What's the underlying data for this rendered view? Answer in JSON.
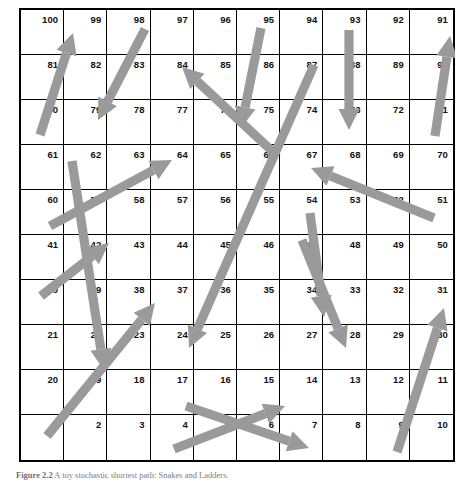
{
  "figure": {
    "caption_label": "Figure 2.2",
    "caption_text": "A toy stochastic shortest path: Snakes and Ladders.",
    "board_title": "Snakes and Ladders board"
  },
  "board": {
    "columns": 10,
    "rows": 10,
    "grid_line_color": "#000000",
    "background_color": "#ffffff",
    "number_color": "#111111",
    "arrow_color": "#9a9a9a",
    "numbering_order": "boustrophedon-bottom-left-start",
    "rows_of_numbers": [
      [
        100,
        99,
        98,
        97,
        96,
        95,
        94,
        93,
        92,
        91
      ],
      [
        81,
        82,
        83,
        84,
        85,
        86,
        87,
        88,
        89,
        90
      ],
      [
        80,
        79,
        78,
        77,
        76,
        75,
        74,
        73,
        72,
        71
      ],
      [
        61,
        62,
        63,
        64,
        65,
        66,
        67,
        68,
        69,
        70
      ],
      [
        60,
        59,
        58,
        57,
        56,
        55,
        54,
        53,
        52,
        51
      ],
      [
        41,
        42,
        43,
        44,
        45,
        46,
        47,
        48,
        49,
        50
      ],
      [
        40,
        39,
        38,
        37,
        36,
        35,
        34,
        33,
        32,
        31
      ],
      [
        21,
        22,
        23,
        24,
        25,
        26,
        27,
        28,
        29,
        30
      ],
      [
        20,
        19,
        18,
        17,
        16,
        15,
        14,
        13,
        12,
        11
      ],
      [
        1,
        2,
        3,
        4,
        5,
        6,
        7,
        8,
        9,
        10
      ]
    ]
  },
  "arrows": [
    {
      "name": "ladder-80-to-100",
      "kind": "ladder",
      "from": 80,
      "to": 100,
      "x1": 21,
      "y1": 127,
      "x2": 54,
      "y2": 25
    },
    {
      "name": "snake-98-to-79",
      "kind": "snake",
      "from": 98,
      "to": 79,
      "x1": 126,
      "y1": 21,
      "x2": 79,
      "y2": 112
    },
    {
      "name": "ladder-65-to-84",
      "kind": "ladder",
      "from": 65,
      "to": 84,
      "x1": 253,
      "y1": 143,
      "x2": 163,
      "y2": 59
    },
    {
      "name": "ladder-60-to-64",
      "kind": "ladder",
      "from": 60,
      "to": 64,
      "x1": 31,
      "y1": 218,
      "x2": 153,
      "y2": 152
    },
    {
      "name": "snake-62-to-19",
      "kind": "snake",
      "from": 62,
      "to": 19,
      "x1": 53,
      "y1": 153,
      "x2": 85,
      "y2": 362
    },
    {
      "name": "snake-95-to-75",
      "kind": "snake",
      "from": 95,
      "to": 75,
      "x1": 242,
      "y1": 20,
      "x2": 222,
      "y2": 120
    },
    {
      "name": "snake-93-to-73",
      "kind": "snake",
      "from": 93,
      "to": 73,
      "x1": 330,
      "y1": 22,
      "x2": 330,
      "y2": 122
    },
    {
      "name": "ladder-71-to-91",
      "kind": "ladder",
      "from": 71,
      "to": 91,
      "x1": 416,
      "y1": 128,
      "x2": 431,
      "y2": 28
    },
    {
      "name": "ladder-52-to-67",
      "kind": "ladder",
      "from": 52,
      "to": 67,
      "x1": 415,
      "y1": 210,
      "x2": 292,
      "y2": 160
    },
    {
      "name": "snake-87-to-24",
      "kind": "snake",
      "from": 87,
      "to": 24,
      "x1": 295,
      "y1": 57,
      "x2": 170,
      "y2": 340
    },
    {
      "name": "snake-54-to-34",
      "kind": "snake",
      "from": 54,
      "to": 34,
      "x1": 291,
      "y1": 205,
      "x2": 305,
      "y2": 309
    },
    {
      "name": "snake-47-to-28",
      "kind": "snake",
      "from": 47,
      "to": 28,
      "x1": 283,
      "y1": 232,
      "x2": 327,
      "y2": 340
    },
    {
      "name": "ladder-21-to-42",
      "kind": "ladder",
      "from": 21,
      "to": 42,
      "x1": 22,
      "y1": 288,
      "x2": 90,
      "y2": 235
    },
    {
      "name": "ladder-1-to-38",
      "kind": "ladder",
      "from": 1,
      "to": 38,
      "x1": 28,
      "y1": 428,
      "x2": 136,
      "y2": 295
    },
    {
      "name": "ladder-4-to-14",
      "kind": "ladder",
      "from": 4,
      "to": 14,
      "x1": 155,
      "y1": 441,
      "x2": 266,
      "y2": 398
    },
    {
      "name": "snake-17-to-7",
      "kind": "snake",
      "from": 17,
      "to": 7,
      "x1": 167,
      "y1": 398,
      "x2": 290,
      "y2": 440
    },
    {
      "name": "ladder-9-to-31",
      "kind": "ladder",
      "from": 9,
      "to": 31,
      "x1": 378,
      "y1": 444,
      "x2": 425,
      "y2": 300
    }
  ]
}
